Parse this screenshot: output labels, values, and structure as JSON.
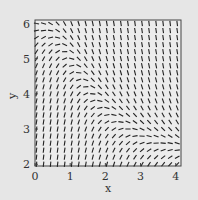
{
  "chart_data": {
    "type": "slope_field",
    "title": "",
    "xlabel": "x",
    "ylabel": "y",
    "xlim": [
      0,
      4.15
    ],
    "ylim": [
      1.95,
      6.1
    ],
    "x_ticks": [
      "0",
      "1",
      "2",
      "3",
      "4"
    ],
    "y_ticks": [
      "2",
      "3",
      "4",
      "5",
      "6"
    ],
    "grid": false,
    "legend": null,
    "grid_x_step": 0.2,
    "grid_y_step": 0.2,
    "nullcline_description": "horizontal slopes along a curve from about (0, 5.9) descending to about (4, 2.0); steep positive slopes below-left, negative slopes above-right",
    "colors": {
      "background": "#e6e6e6",
      "plot_bg": "#ececec",
      "segments": "#222222",
      "frame": "#444444"
    }
  }
}
